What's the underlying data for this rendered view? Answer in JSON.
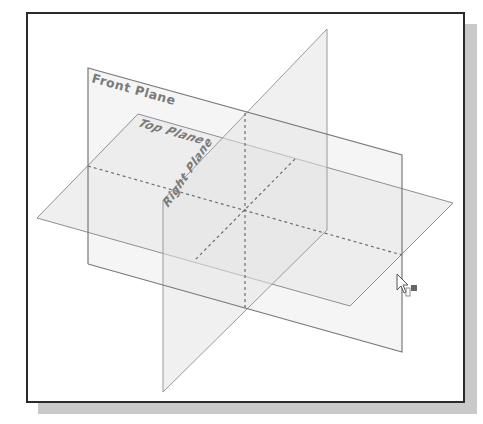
{
  "viewport": {
    "title": "Default reference planes",
    "frame": {
      "border_color": "#2a2a2a",
      "shadow_color": "#c9c9c9",
      "background": "#ffffff"
    }
  },
  "planes": [
    {
      "id": "front",
      "label": "Front Plane"
    },
    {
      "id": "top",
      "label": "Top Plane"
    },
    {
      "id": "right",
      "label": "Right Plane"
    }
  ],
  "colors": {
    "plane_fill": "#ececec",
    "plane_fill_shaded": "#e3e3e3",
    "edge": "#8a8a8a",
    "edge_dark": "#777777",
    "hidden_line": "#6e6e6e",
    "label": "#7a7a7a"
  },
  "cursor": {
    "icon": "arrow-pointer-with-plane-icon",
    "x": 397,
    "y": 276
  }
}
